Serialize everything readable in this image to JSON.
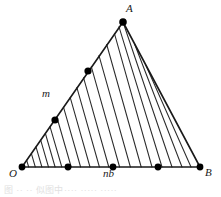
{
  "figure": {
    "type": "geometry-diagram",
    "background_color": "#ffffff",
    "stroke_color": "#1a1a1a",
    "hatch_color": "#2b2b2b",
    "dot_color": "#000000",
    "canvas": {
      "width": 221,
      "height": 197
    },
    "vertices": {
      "O": {
        "x": 22,
        "y": 167
      },
      "A": {
        "x": 123,
        "y": 22
      },
      "B": {
        "x": 200,
        "y": 167
      }
    },
    "edges": [
      {
        "name": "OA",
        "from": "O",
        "to": "A"
      },
      {
        "name": "AB",
        "from": "A",
        "to": "B"
      },
      {
        "name": "OB",
        "from": "O",
        "to": "B"
      }
    ],
    "base_dots": [
      {
        "x": 22,
        "y": 167
      },
      {
        "x": 68,
        "y": 167
      },
      {
        "x": 113,
        "y": 167
      },
      {
        "x": 158,
        "y": 167
      },
      {
        "x": 200,
        "y": 167
      }
    ],
    "side_dots": [
      {
        "x": 22,
        "y": 167
      },
      {
        "x": 55,
        "y": 120
      },
      {
        "x": 88,
        "y": 71
      },
      {
        "x": 123,
        "y": 22
      }
    ],
    "hatch_count": 13,
    "hatch_direction": "parallel-to-AB",
    "labels": [
      {
        "id": "label-A",
        "text": "A",
        "x": 126,
        "y": 5,
        "anchor": "apex"
      },
      {
        "id": "label-m",
        "text": "m",
        "x": 42,
        "y": 92,
        "anchor": "left-edge"
      },
      {
        "id": "label-O",
        "text": "O",
        "x": 10,
        "y": 170,
        "anchor": "bottom-left-vertex"
      },
      {
        "id": "label-nb",
        "text": "nb",
        "x": 104,
        "y": 170,
        "anchor": "baseline-midpoint"
      },
      {
        "id": "label-B",
        "text": "B",
        "x": 205,
        "y": 169,
        "anchor": "bottom-right-vertex"
      }
    ],
    "caption_fragment": "图 ·· ·· 似图中···· ····· ·····"
  }
}
